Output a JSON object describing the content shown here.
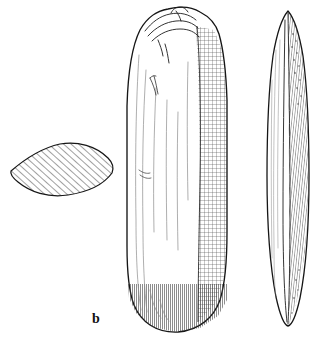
{
  "figure": {
    "label": "b",
    "truncated_header_text": "",
    "background_color": "#ffffff",
    "ink_color": "#1a1a1a",
    "hatch_color": "#2b2b2b",
    "width": 324,
    "height": 343,
    "views": [
      {
        "name": "cross-section",
        "shape": "lenticular",
        "fill": "diagonal-hatch",
        "position": "left"
      },
      {
        "name": "face-view",
        "shape": "elongated-rounded-blade",
        "fill": "crosshatch-shading-right-side",
        "position": "center"
      },
      {
        "name": "profile-view",
        "shape": "narrow-pointed-lens",
        "fill": "fine-line-shading",
        "position": "right"
      }
    ]
  }
}
